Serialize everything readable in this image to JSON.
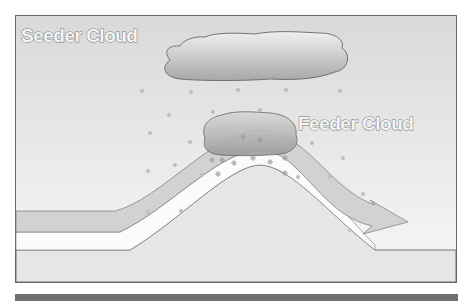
{
  "diagram": {
    "labels": {
      "seeder": "Seeder Cloud",
      "feeder": "Feeder Cloud"
    },
    "colors": {
      "sky_top": "#d6d6d6",
      "sky_bottom": "#f7f7f7",
      "ground": "#e6e6e6",
      "airflow_band": "#d2d2d2",
      "frame": "#6a6a6a",
      "bottom_bar": "#707070",
      "precip_dot": "#bdbdbd"
    },
    "elements": [
      "seeder-cloud",
      "feeder-cloud",
      "hill",
      "airflow-arrow",
      "rain-drops",
      "snowflakes"
    ]
  }
}
